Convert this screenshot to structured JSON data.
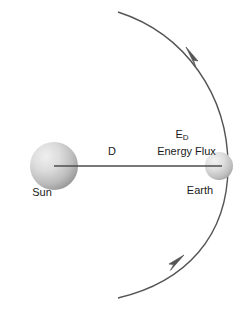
{
  "diagram": {
    "background_color": "#ffffff",
    "stroke_color": "#555555",
    "text_color": "#1a1a1a",
    "bodies": [
      {
        "id": "sun",
        "label": "Sun",
        "cx": 54,
        "cy": 166,
        "r": 24,
        "fill_light": "#e8e8e8",
        "fill_dark": "#9a9a9a"
      },
      {
        "id": "earth",
        "label": "Earth",
        "cx": 219,
        "cy": 166,
        "r": 14,
        "fill_light": "#ececec",
        "fill_dark": "#a8a8a8"
      }
    ],
    "labels": {
      "sun": "Sun",
      "earth": "Earth",
      "distance": "D",
      "flux_symbol_base": "E",
      "flux_symbol_subscript": "D",
      "flux_name": "Energy Flux"
    },
    "orbit": {
      "description": "orbital arc through Earth with directional arrowheads",
      "arrow_count": 2,
      "arrow_direction": "counterclockwise"
    }
  }
}
